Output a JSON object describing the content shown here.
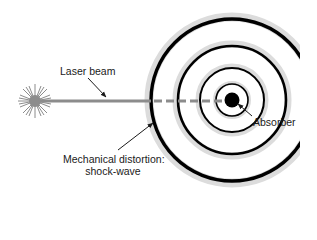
{
  "diagram": {
    "labels": {
      "laser_beam": "Laser beam",
      "absorber": "Absorber",
      "mechanical_line1": "Mechanical distortion:",
      "mechanical_line2": "shock-wave"
    },
    "elements": {
      "laser_source": {
        "icon": "starburst-icon",
        "cx": 35,
        "cy": 101
      },
      "beam": {
        "y": 101,
        "x_start": 35,
        "x_solid_end": 151,
        "x_end": 226,
        "color": "#8c8c8c"
      },
      "absorber": {
        "cx": 232,
        "cy": 100,
        "r": 7,
        "color": "#000000"
      },
      "rings": [
        {
          "r": 16,
          "stroke": 1.6
        },
        {
          "r": 32,
          "stroke": 2.0
        },
        {
          "r": 54,
          "stroke": 2.6
        },
        {
          "r": 81,
          "stroke": 3.4
        }
      ],
      "ring_color": "#000000",
      "ring_halo_color": "#d6d6d6",
      "clip_right_x": 300
    }
  }
}
